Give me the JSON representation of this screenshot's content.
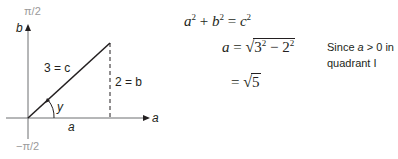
{
  "figure": {
    "axes": {
      "top_label": "π/2",
      "bottom_label": "−π/2",
      "vertical_axis_label": "b",
      "horizontal_axis_label": "a"
    },
    "triangle": {
      "hypotenuse_label": "3 = c",
      "opposite_label": "2 = b",
      "adjacent_label": "a",
      "angle_label": "y"
    }
  },
  "equations": {
    "line1": {
      "a": "a",
      "a_exp": "2",
      "plus": "+",
      "b": "b",
      "b_exp": "2",
      "eq": "=",
      "c": "c",
      "c_exp": "2"
    },
    "line2": {
      "lhs": "a",
      "eq": "=",
      "radical": "√",
      "base1": "3",
      "exp1": "2",
      "minus": "−",
      "base2": "2",
      "exp2": "2"
    },
    "line3": {
      "eq": "=",
      "radical": "√",
      "value": "5"
    },
    "note": {
      "line1_pre": "Since ",
      "line1_var": "a",
      "line1_post": " > 0 in",
      "line2": "quadrant I"
    }
  },
  "colors": {
    "ink": "#231f20",
    "muted_label": "#9a9a9a",
    "axis": "#6d6e71"
  }
}
